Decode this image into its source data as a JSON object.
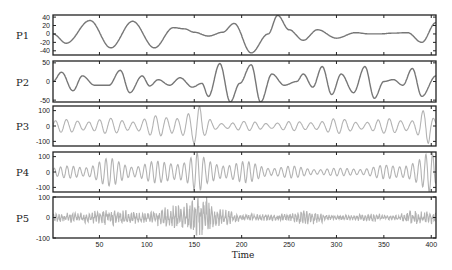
{
  "chart_data": {
    "type": "line",
    "title": "",
    "xlabel": "Time",
    "xlim": [
      1,
      405
    ],
    "xticks": [
      50,
      100,
      150,
      200,
      250,
      300,
      350,
      400
    ],
    "colors": {
      "dark_line": "#777777",
      "light_line": "#b3b3b3",
      "axes": "#222222"
    },
    "panels": [
      {
        "label": "P1",
        "ylim": [
          -50,
          45
        ],
        "yticks": [
          40,
          20,
          0,
          -20,
          -40
        ],
        "color": "#777777",
        "keypoints": [
          [
            1,
            0
          ],
          [
            15,
            -22
          ],
          [
            40,
            32
          ],
          [
            62,
            -33
          ],
          [
            85,
            30
          ],
          [
            108,
            -33
          ],
          [
            128,
            15
          ],
          [
            140,
            12
          ],
          [
            150,
            4
          ],
          [
            165,
            -5
          ],
          [
            180,
            4
          ],
          [
            192,
            25
          ],
          [
            210,
            -45
          ],
          [
            228,
            0
          ],
          [
            238,
            44
          ],
          [
            250,
            10
          ],
          [
            265,
            -15
          ],
          [
            280,
            10
          ],
          [
            300,
            -10
          ],
          [
            320,
            3
          ],
          [
            335,
            0
          ],
          [
            345,
            0
          ],
          [
            360,
            2
          ],
          [
            375,
            3
          ],
          [
            390,
            -20
          ],
          [
            405,
            27
          ]
        ]
      },
      {
        "label": "P2",
        "ylim": [
          -55,
          55
        ],
        "yticks": [
          50,
          0,
          -50
        ],
        "color": "#777777",
        "keypoints": [
          [
            1,
            0
          ],
          [
            10,
            25
          ],
          [
            22,
            -25
          ],
          [
            32,
            15
          ],
          [
            45,
            -10
          ],
          [
            60,
            -10
          ],
          [
            72,
            30
          ],
          [
            82,
            -30
          ],
          [
            95,
            15
          ],
          [
            103,
            -12
          ],
          [
            112,
            5
          ],
          [
            124,
            -10
          ],
          [
            135,
            10
          ],
          [
            148,
            -15
          ],
          [
            158,
            -5
          ],
          [
            165,
            -40
          ],
          [
            177,
            48
          ],
          [
            188,
            -55
          ],
          [
            198,
            -5
          ],
          [
            210,
            45
          ],
          [
            220,
            -55
          ],
          [
            232,
            20
          ],
          [
            245,
            -10
          ],
          [
            258,
            0
          ],
          [
            265,
            20
          ],
          [
            275,
            -15
          ],
          [
            285,
            40
          ],
          [
            295,
            -35
          ],
          [
            305,
            20
          ],
          [
            318,
            -30
          ],
          [
            330,
            40
          ],
          [
            340,
            -45
          ],
          [
            350,
            0
          ],
          [
            360,
            5
          ],
          [
            370,
            -10
          ],
          [
            380,
            35
          ],
          [
            390,
            -40
          ],
          [
            405,
            15
          ]
        ]
      },
      {
        "label": "P3",
        "ylim": [
          -130,
          130
        ],
        "yticks": [
          100,
          0,
          -100
        ],
        "color": "#b3b3b3",
        "style": "oscillating",
        "envelope": [
          [
            1,
            40
          ],
          [
            40,
            50
          ],
          [
            80,
            50
          ],
          [
            120,
            70
          ],
          [
            140,
            110
          ],
          [
            155,
            130
          ],
          [
            162,
            60
          ],
          [
            175,
            30
          ],
          [
            220,
            30
          ],
          [
            260,
            30
          ],
          [
            290,
            50
          ],
          [
            330,
            40
          ],
          [
            380,
            60
          ],
          [
            395,
            120
          ],
          [
            405,
            40
          ]
        ],
        "period": 12
      },
      {
        "label": "P4",
        "ylim": [
          -130,
          130
        ],
        "yticks": [
          100,
          0,
          -100
        ],
        "color": "#b3b3b3",
        "style": "oscillating",
        "envelope": [
          [
            1,
            30
          ],
          [
            30,
            50
          ],
          [
            60,
            90
          ],
          [
            90,
            60
          ],
          [
            110,
            70
          ],
          [
            140,
            100
          ],
          [
            152,
            130
          ],
          [
            165,
            80
          ],
          [
            200,
            70
          ],
          [
            240,
            40
          ],
          [
            300,
            25
          ],
          [
            360,
            45
          ],
          [
            385,
            100
          ],
          [
            400,
            130
          ],
          [
            405,
            80
          ]
        ],
        "period": 7
      },
      {
        "label": "P5",
        "ylim": [
          -100,
          100
        ],
        "yticks": [
          100,
          0,
          -100
        ],
        "color": "#b3b3b3",
        "style": "noisy",
        "envelope": [
          [
            1,
            20
          ],
          [
            30,
            25
          ],
          [
            60,
            40
          ],
          [
            100,
            30
          ],
          [
            130,
            60
          ],
          [
            150,
            80
          ],
          [
            160,
            110
          ],
          [
            175,
            40
          ],
          [
            200,
            20
          ],
          [
            240,
            15
          ],
          [
            270,
            35
          ],
          [
            300,
            10
          ],
          [
            340,
            20
          ],
          [
            360,
            10
          ],
          [
            380,
            35
          ],
          [
            405,
            30
          ]
        ],
        "period": 3
      }
    ]
  }
}
